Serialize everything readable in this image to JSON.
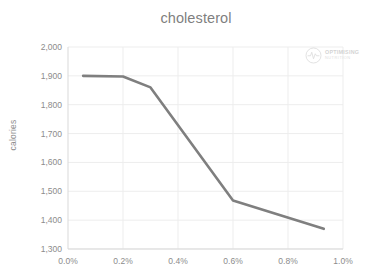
{
  "chart_data": {
    "type": "line",
    "title": "cholesterol",
    "xlabel": "",
    "ylabel": "calories",
    "xlim": [
      0.0,
      1.0
    ],
    "ylim": [
      1300,
      2000
    ],
    "x_tick_labels": [
      "0.0%",
      "0.2%",
      "0.4%",
      "0.6%",
      "0.8%",
      "1.0%"
    ],
    "x_ticks": [
      0.0,
      0.2,
      0.4,
      0.6,
      0.8,
      1.0
    ],
    "y_tick_labels": [
      "2,000",
      "1,900",
      "1,800",
      "1,700",
      "1,600",
      "1,500",
      "1,400",
      "1,300"
    ],
    "y_ticks": [
      2000,
      1900,
      1800,
      1700,
      1600,
      1500,
      1400,
      1300
    ],
    "grid": true,
    "legend": "none",
    "series": [
      {
        "name": "cholesterol",
        "color": "#7f7f7f",
        "x": [
          0.055,
          0.2,
          0.3,
          0.6,
          0.93
        ],
        "values": [
          1900,
          1898,
          1860,
          1468,
          1370
        ]
      }
    ]
  },
  "watermark": {
    "line1": "OPTIMISING",
    "line2": "NUTRITION",
    "icon": "pulse-circle-icon"
  },
  "colors": {
    "line": "#7f7f7f",
    "grid": "#ededed",
    "axis": "#d9d9d9",
    "text": "#8c8c8c",
    "title": "#7f7f7f",
    "background": "#ffffff"
  }
}
